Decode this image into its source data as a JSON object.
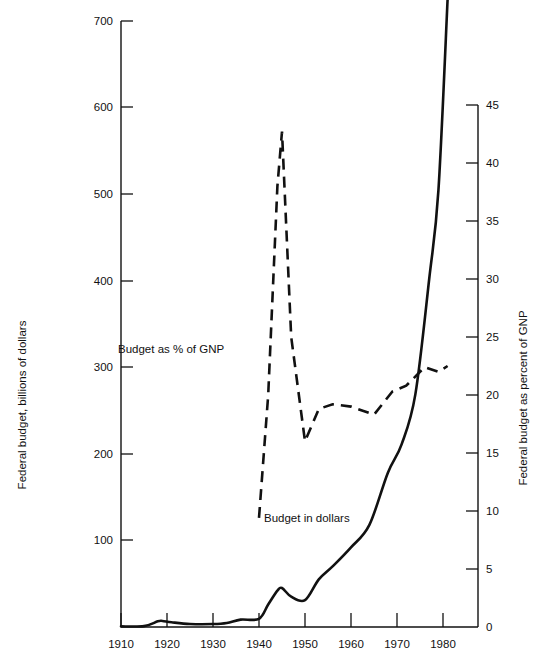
{
  "chart_data": {
    "type": "line",
    "title": "",
    "subtitle": "",
    "xlabel": "",
    "ylabel": "Federal budget, billions of dollars",
    "y2label": "Federal budget as percent of GNP",
    "grid": false,
    "legend_position": "inline-annotations",
    "xlim": [
      1910,
      1983
    ],
    "ylim": [
      0,
      700
    ],
    "y2lim": [
      0,
      45
    ],
    "x_ticks": [
      1910,
      1920,
      1930,
      1940,
      1950,
      1960,
      1970,
      1980
    ],
    "x_tick_labels": [
      "1910",
      "1920",
      "1930",
      "1940",
      "1950",
      "1960",
      "1970",
      "1980"
    ],
    "y_ticks": [
      100,
      200,
      300,
      400,
      500,
      600,
      700
    ],
    "y_tick_labels": [
      "100",
      "200",
      "300",
      "400",
      "500",
      "600",
      "700"
    ],
    "y2_ticks": [
      0,
      5,
      10,
      15,
      20,
      25,
      30,
      35,
      40,
      45
    ],
    "y2_tick_labels": [
      "0",
      "5",
      "10",
      "15",
      "20",
      "25",
      "30",
      "35",
      "40",
      "45"
    ],
    "series": [
      {
        "name": "Budget in dollars",
        "style": "solid",
        "axis": "left",
        "units": "billions of dollars",
        "x": [
          1910,
          1915,
          1918,
          1919,
          1921,
          1925,
          1930,
          1933,
          1936,
          1940,
          1942,
          1944,
          1945,
          1947,
          1950,
          1953,
          1956,
          1960,
          1964,
          1968,
          1971,
          1974,
          1977,
          1979,
          1981
        ],
        "values": [
          0.7,
          1.0,
          6.5,
          7.0,
          5.5,
          3.5,
          3.4,
          4.6,
          8.5,
          9.5,
          26,
          42,
          45,
          35,
          31,
          55,
          70,
          92,
          118,
          178,
          211,
          269,
          402,
          504,
          725
        ]
      },
      {
        "name": "Budget as % of GNP",
        "style": "dashed",
        "axis": "right",
        "units": "percent of GNP",
        "x": [
          1940,
          1942,
          1944,
          1945,
          1947,
          1950,
          1953,
          1956,
          1960,
          1965,
          1969,
          1972,
          1976,
          1979,
          1981
        ],
        "values": [
          9.4,
          20.0,
          38.0,
          42.7,
          25.0,
          16.0,
          18.8,
          19.2,
          19.0,
          18.3,
          20.3,
          20.8,
          22.4,
          22.0,
          22.5
        ]
      }
    ],
    "annotations": [
      {
        "text": "Budget as % of GNP",
        "x_px": 118,
        "y_px": 353
      },
      {
        "text": "Budget in dollars",
        "x_px": 264,
        "y_px": 522
      }
    ]
  },
  "axes": {
    "left": {
      "title": "Federal budget, billions of dollars"
    },
    "right": {
      "title": "Federal budget as percent of GNP"
    }
  }
}
